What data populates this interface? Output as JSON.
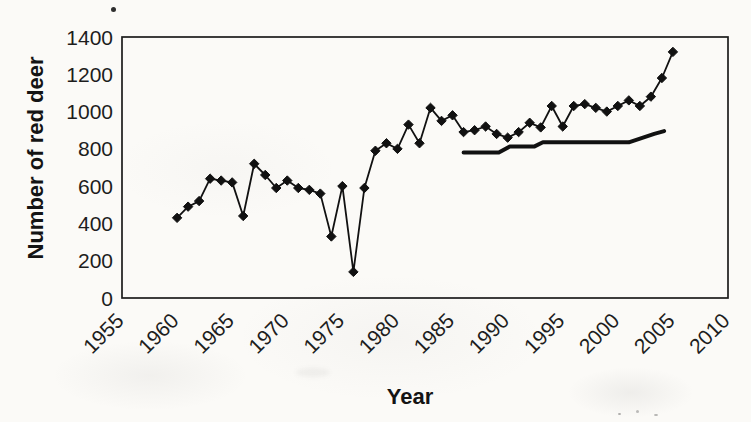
{
  "colors": {
    "paper": "#fbfaf7",
    "ink": "#1d1d1d",
    "series": "#111111"
  },
  "chart_data": {
    "type": "line",
    "title": "",
    "xlabel": "Year",
    "ylabel": "Number of red deer",
    "xlim": [
      1955,
      2010
    ],
    "ylim": [
      0,
      1400
    ],
    "x_ticks": [
      1955,
      1960,
      1965,
      1970,
      1975,
      1980,
      1985,
      1990,
      1995,
      2000,
      2005,
      2010
    ],
    "y_ticks": [
      0,
      200,
      400,
      600,
      800,
      1000,
      1200,
      1400
    ],
    "grid": false,
    "legend": "none",
    "series": [
      {
        "name": "red deer count (diamond markers)",
        "marker": "diamond",
        "color": "#111111",
        "x": [
          1960,
          1961,
          1962,
          1963,
          1964,
          1965,
          1966,
          1967,
          1968,
          1969,
          1970,
          1971,
          1972,
          1973,
          1974,
          1975,
          1976,
          1977,
          1978,
          1979,
          1980,
          1981,
          1982,
          1983,
          1984,
          1985,
          1986,
          1987,
          1988,
          1989,
          1990,
          1991,
          1992,
          1993,
          1994,
          1995,
          1996,
          1997,
          1998,
          1999,
          2000,
          2001,
          2002,
          2003,
          2004,
          2005
        ],
        "values": [
          430,
          490,
          520,
          640,
          630,
          620,
          440,
          720,
          660,
          590,
          630,
          590,
          580,
          560,
          330,
          600,
          140,
          590,
          790,
          830,
          800,
          930,
          830,
          1020,
          950,
          980,
          890,
          900,
          920,
          880,
          860,
          890,
          940,
          915,
          1030,
          920,
          1030,
          1040,
          1020,
          1000,
          1030,
          1060,
          1030,
          1080,
          1180,
          1320
        ]
      },
      {
        "name": "reference line (no markers)",
        "marker": "none",
        "color": "#111111",
        "points": [
          [
            1986,
            780
          ],
          [
            1989.2,
            780
          ],
          [
            1990.2,
            812
          ],
          [
            1992.4,
            812
          ],
          [
            1993.2,
            835
          ],
          [
            2001,
            835
          ],
          [
            2003.3,
            880
          ],
          [
            2004.2,
            895
          ]
        ]
      }
    ]
  }
}
